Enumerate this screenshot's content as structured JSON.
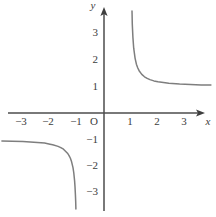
{
  "chart_data": {
    "type": "line",
    "xlabel": "x",
    "ylabel": "y",
    "origin_label": "O",
    "xlim": [
      -3.8,
      3.8
    ],
    "ylim": [
      -3.7,
      3.9
    ],
    "grid": false,
    "legend": false,
    "x_tick_labels": [
      "−3",
      "−2",
      "−1",
      "1",
      "2",
      "3"
    ],
    "y_tick_labels": [
      "3",
      "2",
      "1",
      "−1",
      "−2",
      "−3"
    ],
    "x_tick_values": [
      -3,
      -2,
      -1,
      1,
      2,
      3
    ],
    "y_tick_values": [
      3,
      2,
      1,
      -1,
      -2,
      -3
    ],
    "asymptotes": {
      "vertical": [
        -1,
        1
      ],
      "horizontal": [
        -1,
        1
      ]
    },
    "series": [
      {
        "name": "left-branch",
        "points": [
          [
            -3.78,
            -1.037
          ],
          [
            -3.4,
            -1.045
          ],
          [
            -3.0,
            -1.061
          ],
          [
            -2.6,
            -1.083
          ],
          [
            -2.2,
            -1.116
          ],
          [
            -2.0,
            -1.155
          ],
          [
            -1.9,
            -1.176
          ],
          [
            -1.7,
            -1.236
          ],
          [
            -1.6,
            -1.281
          ],
          [
            -1.5,
            -1.342
          ],
          [
            -1.35,
            -1.489
          ],
          [
            -1.3,
            -1.565
          ],
          [
            -1.25,
            -1.667
          ],
          [
            -1.2,
            -1.809
          ],
          [
            -1.15,
            -2.025
          ],
          [
            -1.12,
            -2.221
          ],
          [
            -1.09,
            -2.513
          ],
          [
            -1.075,
            -2.725
          ],
          [
            -1.06,
            -3.015
          ],
          [
            -1.05,
            -3.28
          ],
          [
            -1.042,
            -3.558
          ]
        ]
      },
      {
        "name": "right-branch",
        "points": [
          [
            1.037,
            3.776
          ],
          [
            1.04,
            3.64
          ],
          [
            1.05,
            3.28
          ],
          [
            1.07,
            2.811
          ],
          [
            1.1,
            2.4
          ],
          [
            1.15,
            2.025
          ],
          [
            1.2,
            1.809
          ],
          [
            1.25,
            1.667
          ],
          [
            1.3,
            1.565
          ],
          [
            1.4,
            1.429
          ],
          [
            1.5,
            1.342
          ],
          [
            1.6,
            1.281
          ],
          [
            1.7,
            1.236
          ],
          [
            1.85,
            1.189
          ],
          [
            2.0,
            1.155
          ],
          [
            2.4,
            1.1
          ],
          [
            2.8,
            1.071
          ],
          [
            3.2,
            1.053
          ],
          [
            3.6,
            1.041
          ],
          [
            3.96,
            1.033
          ]
        ]
      }
    ]
  },
  "colors": {
    "axis": "#4c4c4c",
    "curve": "#7e7e7e",
    "text": "#3c3c3c",
    "background": "#ffffff"
  }
}
